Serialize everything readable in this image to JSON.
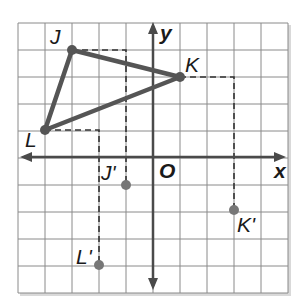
{
  "graph": {
    "axis_labels": {
      "x": "x",
      "y": "y",
      "origin": "O"
    },
    "grid": {
      "x_min": -5,
      "x_max": 5,
      "y_min": -5,
      "y_max": 5
    },
    "colors": {
      "grid": "#8a8a8a",
      "axis": "#4a4a4a",
      "triangle": "#555555",
      "point": "#666666",
      "dash": "#333333"
    },
    "triangle": [
      {
        "name": "J",
        "x": -3,
        "y": 4
      },
      {
        "name": "K",
        "x": 1,
        "y": 3
      },
      {
        "name": "L",
        "x": -4,
        "y": 1
      }
    ],
    "image_points": [
      {
        "name": "J'",
        "x": -1,
        "y": -1
      },
      {
        "name": "K'",
        "x": 3,
        "y": -2
      },
      {
        "name": "L'",
        "x": -2,
        "y": -4
      }
    ]
  }
}
